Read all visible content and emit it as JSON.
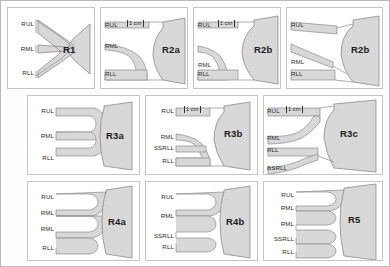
{
  "figure": {
    "background_color": "#fdfdfd",
    "border_color": "#b9b9b9",
    "airway_fill": "#d8d8d8",
    "airway_stroke": "#8a8a8a"
  },
  "scale_marker": {
    "label": "1 cm"
  },
  "panels": [
    {
      "code": "R1",
      "row": 1,
      "column": 1,
      "has_scale": false,
      "branches": [
        "RUL",
        "RML",
        "RLL"
      ],
      "shape": "trifurcation"
    },
    {
      "code": "R2a",
      "row": 1,
      "column": 2,
      "has_scale": true,
      "branches": [
        "RUL",
        "RML",
        "RLL"
      ],
      "shape": "curved-notch"
    },
    {
      "code": "R2b",
      "row": 1,
      "column": 3,
      "has_scale": true,
      "branches": [
        "RUL",
        "RML",
        "RLL"
      ],
      "shape": "wide-notch"
    },
    {
      "code": "R2b",
      "row": 1,
      "column": 4,
      "has_scale": false,
      "branches": [
        "RUL",
        "RML",
        "RLL"
      ],
      "shape": "oblique-notch"
    },
    {
      "code": "R3a",
      "row": 2,
      "column": 1,
      "has_scale": false,
      "branches": [
        "RUL",
        "RML",
        "RLL"
      ],
      "shape": "three-parallel"
    },
    {
      "code": "R3b",
      "row": 2,
      "column": 2,
      "has_scale": true,
      "branches": [
        "RUL",
        "RML",
        "SSRLL",
        "RLL"
      ],
      "shape": "four-branch-curved"
    },
    {
      "code": "R3c",
      "row": 2,
      "column": 3,
      "has_scale": true,
      "branches": [
        "RUL",
        "RML",
        "RLL",
        "BSRLL"
      ],
      "shape": "four-branch-basal"
    },
    {
      "code": "R4a",
      "row": 3,
      "column": 1,
      "has_scale": false,
      "branches": [
        "RUL",
        "RML",
        "RML",
        "RLL"
      ],
      "shape": "four-parallel"
    },
    {
      "code": "R4b",
      "row": 3,
      "column": 2,
      "has_scale": false,
      "branches": [
        "RUL",
        "RML",
        "SSRLL",
        "RLL"
      ],
      "shape": "four-parallel-paired"
    },
    {
      "code": "R5",
      "row": 3,
      "column": 3,
      "has_scale": false,
      "branches": [
        "RUL",
        "RML",
        "RML",
        "SSRLL",
        "RLL"
      ],
      "shape": "five-parallel"
    }
  ]
}
